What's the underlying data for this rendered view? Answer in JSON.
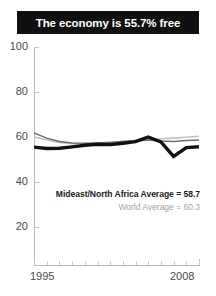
{
  "title": {
    "text": "The economy is 55.7% free"
  },
  "annotations": {
    "regional": "Mideast/North Africa Average = 58.7",
    "world": "World Average = 60.3"
  },
  "axis": {
    "y_ticks": [
      100,
      80,
      60,
      40,
      20
    ],
    "x_start_label": "1995",
    "x_end_label": "2008"
  },
  "colors": {
    "title_bar": "#101010",
    "title_text": "#ffffff",
    "country_line": "#111111",
    "regional_line": "#6f6f6f",
    "world_line": "#c0c0c0",
    "axis": "#b9b9b9",
    "tick_label": "#4a4a4a",
    "annotation_regional": "#1b1b1b",
    "annotation_world": "#a6a6a6"
  },
  "chart_data": {
    "type": "line",
    "title": "The economy is 55.7% free",
    "xlabel": "",
    "ylabel": "",
    "xlim": [
      1995,
      2008
    ],
    "ylim": [
      0,
      100
    ],
    "yticks": [
      20,
      40,
      60,
      80,
      100
    ],
    "grid": false,
    "legend": "inline-annotation",
    "x": [
      1995,
      1996,
      1997,
      1998,
      1999,
      2000,
      2001,
      2002,
      2003,
      2004,
      2005,
      2006,
      2007,
      2008
    ],
    "series": [
      {
        "name": "Country economic freedom score",
        "style": "thick-black",
        "values": [
          55.5,
          54.9,
          55.0,
          55.6,
          56.3,
          56.8,
          56.6,
          57.2,
          57.9,
          60.0,
          57.8,
          51.4,
          55.3,
          55.7
        ]
      },
      {
        "name": "Mideast/North Africa Average",
        "style": "thin-gray",
        "final_value": 58.7,
        "values": [
          61.8,
          59.5,
          58.0,
          57.3,
          57.2,
          57.3,
          57.6,
          58.0,
          58.2,
          58.6,
          58.2,
          58.0,
          58.4,
          58.7
        ]
      },
      {
        "name": "World Average",
        "style": "thin-lightgray",
        "final_value": 60.3,
        "values": [
          60.0,
          58.8,
          57.6,
          57.0,
          57.1,
          57.4,
          57.7,
          58.1,
          58.4,
          58.8,
          59.2,
          59.5,
          59.9,
          60.3
        ]
      }
    ],
    "annotations": [
      {
        "text": "Mideast/North Africa Average = 58.7",
        "value": 58.7
      },
      {
        "text": "World Average = 60.3",
        "value": 60.3
      }
    ]
  }
}
